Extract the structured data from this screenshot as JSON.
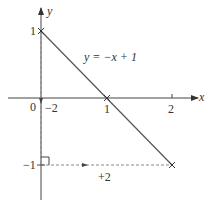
{
  "diagram": {
    "type": "coordinate-graph",
    "axes": {
      "x_label": "x",
      "y_label": "y",
      "origin_label": "0",
      "x_ticks": [
        "1",
        "2"
      ],
      "y_ticks": [
        "1",
        "−1"
      ]
    },
    "line": {
      "equation": "y = −x + 1",
      "points": [
        [
          0,
          1
        ],
        [
          1,
          0
        ],
        [
          2,
          -1
        ]
      ]
    },
    "annotations": {
      "vertical_step": "−2",
      "horizontal_step": "+2"
    },
    "colors": {
      "line": "#555555",
      "dashed": "#777777",
      "text": "#333333"
    }
  }
}
